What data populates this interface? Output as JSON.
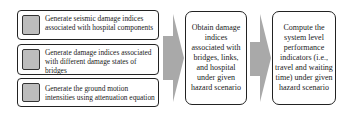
{
  "diagram": {
    "input_steps": [
      {
        "label": "Generate seismic damage indices associated with hospital components"
      },
      {
        "label": "Generate damage indices associated with different damage states of bridges"
      },
      {
        "label": "Generate the ground motion intensities using attenuation equation"
      }
    ],
    "middle_step": {
      "label": "Obtain damage indices associated with bridges, links, and hospital under given hazard scenario"
    },
    "final_step": {
      "label": "Compute the system level performance indicators (i.e., travel and waiting time) under given hazard scenario"
    },
    "colors": {
      "arrow": "#a9a9a9",
      "marker": "#bdbdbd",
      "border": "#222222"
    }
  }
}
